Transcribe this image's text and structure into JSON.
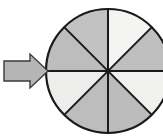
{
  "figure": {
    "name": "eighths-fraction-circle-with-pointer",
    "background_color": "#FFFFFF",
    "width": 163,
    "height": 136
  },
  "circle": {
    "name": "fraction-circle",
    "center_x": 108,
    "center_y": 71,
    "radius": 62,
    "outline_color": "#1A1A1A",
    "outline_width": 2.2,
    "divider_color": "#1A1A1A",
    "divider_width": 2.0,
    "sector_count": 8,
    "sector_angle_degrees": 45,
    "shaded_count": 5,
    "light_count": 3,
    "fraction_label": "5/8",
    "sectors": [
      {
        "name": "sector-1",
        "index": 1,
        "start_deg": 0,
        "end_deg": 45,
        "clock_position": "12 to 1:30",
        "shade": "light",
        "fill": "#F4F4F2"
      },
      {
        "name": "sector-2",
        "index": 2,
        "start_deg": 45,
        "end_deg": 90,
        "clock_position": "1:30 to 3",
        "shade": "shaded",
        "fill": "#BFBFBF"
      },
      {
        "name": "sector-3",
        "index": 3,
        "start_deg": 90,
        "end_deg": 135,
        "clock_position": "3 to 4:30",
        "shade": "light",
        "fill": "#F0F0EE"
      },
      {
        "name": "sector-4",
        "index": 4,
        "start_deg": 135,
        "end_deg": 180,
        "clock_position": "4:30 to 6",
        "shade": "shaded",
        "fill": "#BCBCBC"
      },
      {
        "name": "sector-5",
        "index": 5,
        "start_deg": 180,
        "end_deg": 225,
        "clock_position": "6 to 7:30",
        "shade": "shaded",
        "fill": "#BDBDBD"
      },
      {
        "name": "sector-6",
        "index": 6,
        "start_deg": 225,
        "end_deg": 270,
        "clock_position": "7:30 to 9",
        "shade": "light",
        "fill": "#EDEDEB"
      },
      {
        "name": "sector-7",
        "index": 7,
        "start_deg": 270,
        "end_deg": 315,
        "clock_position": "9 to 10:30",
        "shade": "shaded",
        "fill": "#BDBDBD"
      },
      {
        "name": "sector-8",
        "index": 8,
        "start_deg": 315,
        "end_deg": 360,
        "clock_position": "10:30 to 12",
        "shade": "shaded",
        "fill": "#C2C2C2"
      }
    ]
  },
  "arrow": {
    "name": "pointer-arrow",
    "direction": "right",
    "fill": "#B5B5B5",
    "outline_color": "#3A3A3A",
    "outline_width": 1.4,
    "tail_left": 4,
    "tail_top": 61,
    "tail_bottom": 81,
    "head_tip_x": 48,
    "head_top": 54,
    "head_bottom": 88,
    "shaft_right_x": 30
  }
}
